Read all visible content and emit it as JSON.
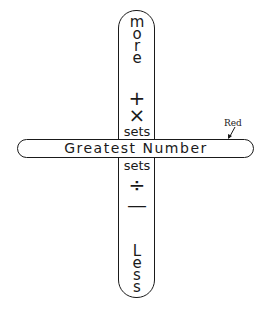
{
  "vertical_bar": {
    "top_letters": [
      "m",
      "o",
      "r",
      "e"
    ],
    "top_word": "more",
    "symbols_top": [
      "+",
      "×"
    ],
    "label_above": "sets",
    "label_below": "sets",
    "symbols_bottom": [
      "÷",
      "—"
    ],
    "bottom_letters": [
      "L",
      "e",
      "s",
      "s"
    ],
    "bottom_word": "Less"
  },
  "horizontal_bar": {
    "label": "Greatest Number"
  },
  "annotation": {
    "label": "Red",
    "arrow": "arrow-pointing-to-horizontal-bar"
  }
}
